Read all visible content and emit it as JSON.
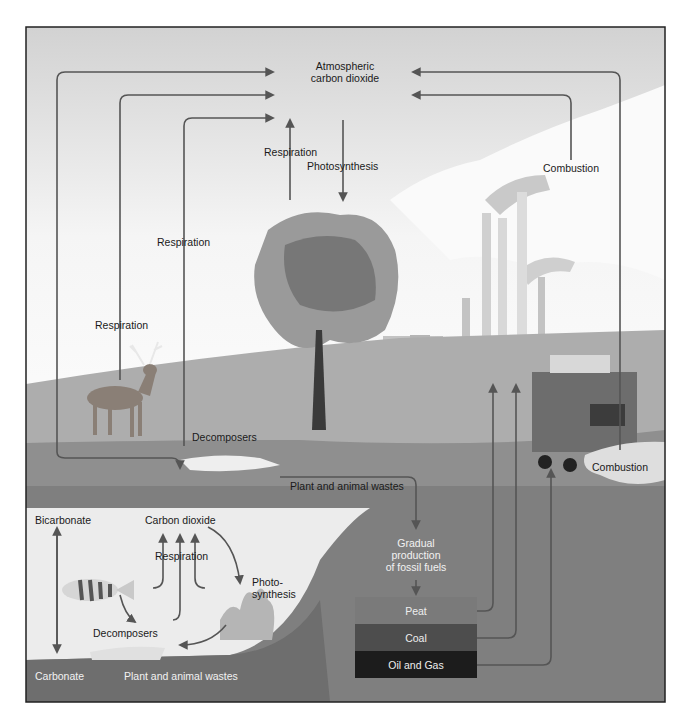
{
  "diagram": {
    "atmosphere": {
      "line1": "Atmospheric",
      "line2": "carbon dioxide"
    },
    "land": {
      "tree_respiration": "Respiration",
      "tree_photosynthesis": "Photosynthesis",
      "respiration_decomposers": "Respiration",
      "respiration_deer": "Respiration",
      "decomposers": "Decomposers",
      "plant_animal_wastes": "Plant and animal wastes",
      "combustion_factory": "Combustion",
      "combustion_vehicle": "Combustion"
    },
    "fossil": {
      "line1": "Gradual",
      "line2": "production",
      "line3": "of fossil fuels",
      "layers": [
        {
          "label": "Peat",
          "color": "#7a7a7a"
        },
        {
          "label": "Coal",
          "color": "#4d4d4d"
        },
        {
          "label": "Oil and Gas",
          "color": "#1c1c1c"
        }
      ]
    },
    "water": {
      "bicarbonate": "Bicarbonate",
      "carbonate": "Carbonate",
      "carbon_dioxide": "Carbon dioxide",
      "respiration": "Respiration",
      "photo_line1": "Photo-",
      "photo_line2": "synthesis",
      "decomposers": "Decomposers",
      "wastes": "Plant and animal wastes"
    },
    "colors": {
      "sky_top": "#d4d4d4",
      "sky_bottom": "#f7f7f7",
      "ground_light": "#a9a9a9",
      "ground_mid": "#8d8d8d",
      "earth": "#7f7f7f",
      "water": "#ececec",
      "arrow": "#555555",
      "frame": "#222222"
    }
  }
}
